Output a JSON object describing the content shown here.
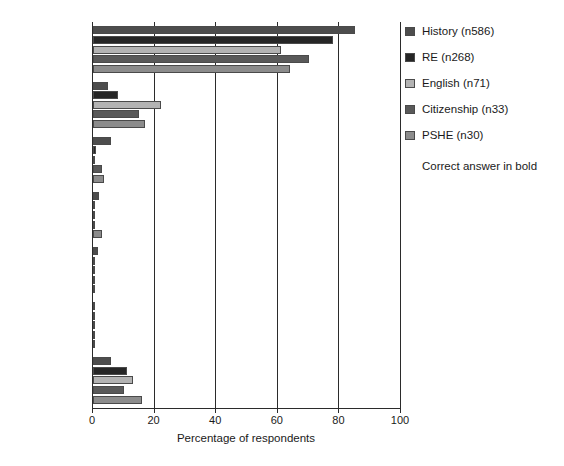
{
  "chart_data": {
    "type": "bar",
    "orientation": "horizontal",
    "title": "",
    "xlabel": "Percentage of respondents",
    "ylabel": "",
    "xlim": [
      0,
      100
    ],
    "xticks": [
      0,
      20,
      40,
      60,
      80,
      100
    ],
    "grid": true,
    "legend_position": "right",
    "categories": [
      "Poland",
      "Germany",
      "Ukraine",
      "Hungary",
      "France",
      "Netherlands",
      "not sure"
    ],
    "bold_categories": [
      "Poland"
    ],
    "series": [
      {
        "name": "History (n586)",
        "color": "#4d4d4d",
        "values": [
          85,
          5,
          6,
          2,
          1.5,
          0.3,
          6
        ]
      },
      {
        "name": "RE (n268)",
        "color": "#262626",
        "values": [
          78,
          8,
          1,
          0.4,
          0.5,
          0.2,
          11
        ]
      },
      {
        "name": "English (n71)",
        "color": "#b3b3b3",
        "values": [
          61,
          22,
          0.5,
          0.2,
          0.3,
          0.1,
          13
        ]
      },
      {
        "name": "Citizenship (n33)",
        "color": "#595959",
        "values": [
          70,
          15,
          3,
          0.2,
          0.4,
          0.1,
          10
        ]
      },
      {
        "name": "PSHE (n30)",
        "color": "#8c8c8c",
        "values": [
          64,
          17,
          3.5,
          3,
          0.5,
          0.1,
          16
        ]
      }
    ],
    "annotation": "Correct answer in bold"
  },
  "legend": {
    "note": "Correct answer in bold"
  }
}
